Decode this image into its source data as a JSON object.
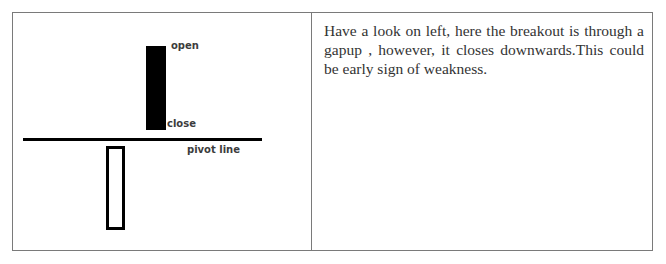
{
  "diagram": {
    "labels": {
      "open": "open",
      "close": "close",
      "pivot": "pivot line"
    },
    "elements": [
      {
        "type": "filled-candle",
        "meaning": "gap-up candle closing downwards, above pivot"
      },
      {
        "type": "pivot-line"
      },
      {
        "type": "hollow-candle",
        "meaning": "previous candle below pivot"
      }
    ]
  },
  "description": "Have a look on left, here the breakout is through a gapup , however, it closes downwards.This could be early sign of weakness."
}
